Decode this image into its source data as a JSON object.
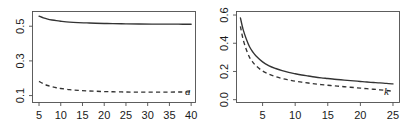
{
  "figure": {
    "background": "#ffffff",
    "line_color": "#333333",
    "axis_color": "#4d4d4d",
    "panel_count": 2
  },
  "chart_data": [
    {
      "type": "line",
      "panel": "left",
      "title": "",
      "xlabel": "a",
      "ylabel": "",
      "xlim": [
        3.5,
        41.0
      ],
      "ylim": [
        0.06,
        0.585
      ],
      "grid": false,
      "legend": "none",
      "xticks": [
        5,
        10,
        15,
        20,
        25,
        30,
        35,
        40
      ],
      "xtick_labels": [
        "5",
        "10",
        "15",
        "20",
        "25",
        "30",
        "35",
        "40"
      ],
      "yticks": [
        0.1,
        0.3,
        0.5
      ],
      "ytick_labels": [
        "0.1",
        "0.3",
        "0.5"
      ],
      "x": [
        5,
        6,
        7,
        8,
        9,
        10,
        12,
        14,
        16,
        18,
        20,
        22,
        25,
        28,
        31,
        34,
        37,
        40
      ],
      "series": [
        {
          "name": "solid",
          "style": "solid",
          "values": [
            0.558,
            0.548,
            0.541,
            0.536,
            0.532,
            0.529,
            0.524,
            0.521,
            0.519,
            0.517,
            0.516,
            0.515,
            0.514,
            0.513,
            0.5125,
            0.512,
            0.5118,
            0.5115
          ]
        },
        {
          "name": "dashed",
          "style": "dashed",
          "values": [
            0.182,
            0.168,
            0.158,
            0.151,
            0.145,
            0.141,
            0.134,
            0.13,
            0.127,
            0.125,
            0.123,
            0.122,
            0.1205,
            0.12,
            0.1198,
            0.12,
            0.1205,
            0.1215
          ]
        }
      ],
      "annotations": [
        {
          "text": "a",
          "x": 39.2,
          "y": 0.105,
          "style": "italic"
        }
      ]
    },
    {
      "type": "line",
      "panel": "right",
      "title": "",
      "xlabel": "k",
      "ylabel": "",
      "xlim": [
        1.0,
        26.0
      ],
      "ylim": [
        -0.02,
        0.625
      ],
      "grid": false,
      "legend": "none",
      "xticks": [
        5,
        10,
        15,
        20,
        25
      ],
      "xtick_labels": [
        "5",
        "10",
        "15",
        "20",
        "25"
      ],
      "yticks": [
        0.0,
        0.2,
        0.4,
        0.6
      ],
      "ytick_labels": [
        "0.0",
        "0.2",
        "0.4",
        "0.6"
      ],
      "x": [
        1.6,
        2,
        2.5,
        3,
        3.5,
        4,
        5,
        6,
        7,
        8,
        9,
        10,
        11,
        12,
        13,
        14,
        15,
        16,
        17,
        18,
        19,
        20,
        21,
        22,
        23,
        24,
        25
      ],
      "series": [
        {
          "name": "solid",
          "style": "solid",
          "values": [
            0.58,
            0.5,
            0.43,
            0.375,
            0.338,
            0.31,
            0.268,
            0.24,
            0.221,
            0.206,
            0.194,
            0.184,
            0.175,
            0.168,
            0.161,
            0.155,
            0.15,
            0.145,
            0.141,
            0.137,
            0.133,
            0.129,
            0.125,
            0.122,
            0.119,
            0.115,
            0.112
          ]
        },
        {
          "name": "dashed",
          "style": "dashed",
          "values": [
            0.52,
            0.43,
            0.355,
            0.3,
            0.266,
            0.24,
            0.203,
            0.18,
            0.163,
            0.15,
            0.14,
            0.131,
            0.124,
            0.118,
            0.112,
            0.107,
            0.102,
            0.098,
            0.094,
            0.09,
            0.086,
            0.082,
            0.078,
            0.074,
            0.07,
            0.065,
            0.06
          ]
        }
      ],
      "annotations": [
        {
          "text": "k",
          "x": 24.0,
          "y": 0.035,
          "style": "italic"
        }
      ]
    }
  ]
}
